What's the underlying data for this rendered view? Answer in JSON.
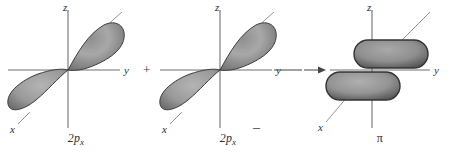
{
  "figure": {
    "background_color": "#ffffff",
    "axis_color": "#6b6b6b",
    "lobe_fill_light": "#b9b9b9",
    "lobe_fill_dark": "#6a6a6a",
    "lobe_stroke": "#3a3a3a",
    "text_color": "#2e2e2e"
  },
  "operators": {
    "plus": "+",
    "minus": "–",
    "arrow": "→"
  },
  "panels": [
    {
      "id": "left-2px-orbital",
      "caption_main": "2p",
      "caption_sub": "x",
      "orbital_type": "2p",
      "axes": [
        {
          "name": "z-axis",
          "label": "z"
        },
        {
          "name": "y-axis",
          "label": "y"
        },
        {
          "name": "x-axis",
          "label": "x"
        }
      ],
      "lobes": 2,
      "lobe_shape": "teardrop"
    },
    {
      "id": "right-2px-orbital",
      "caption_main": "2p",
      "caption_sub": "x",
      "orbital_type": "2p",
      "axes": [
        {
          "name": "z-axis",
          "label": "z"
        },
        {
          "name": "y-axis",
          "label": "y"
        },
        {
          "name": "x-axis",
          "label": "x"
        }
      ],
      "lobes": 2,
      "lobe_shape": "teardrop"
    },
    {
      "id": "pi-molecular-orbital",
      "caption_main": "π",
      "caption_sub": "",
      "orbital_type": "pi",
      "axes": [
        {
          "name": "z-axis",
          "label": "z"
        },
        {
          "name": "y-axis",
          "label": "y"
        },
        {
          "name": "x-axis",
          "label": "x"
        }
      ],
      "lobes": 2,
      "lobe_shape": "rounded-pill"
    }
  ]
}
